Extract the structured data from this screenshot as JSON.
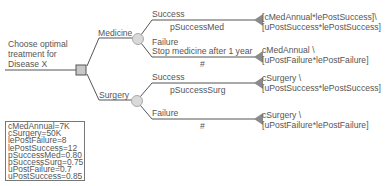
{
  "root": {
    "title_lines": [
      "Choose optimal",
      "treatment for",
      "Disease X"
    ],
    "node_type": "decision"
  },
  "branches": [
    {
      "label": "Medicine",
      "node_type": "chance",
      "outcomes": [
        {
          "label": "Success",
          "probability": "pSuccessMed",
          "payoff_lines": [
            "[cMedAnnual*lePostSuccess]\\",
            "[uPostSuccess*lePostSuccess]"
          ]
        },
        {
          "label": "Failure",
          "sublabel": "Stop medicine after 1 year",
          "probability": "#",
          "payoff_lines": [
            "cMedAnnual \\",
            "[uPostFailure*lePostFailure]"
          ]
        }
      ]
    },
    {
      "label": "Surgery",
      "node_type": "chance",
      "outcomes": [
        {
          "label": "Success",
          "probability": "pSuccessSurg",
          "payoff_lines": [
            "cSurgery \\",
            "[uPostSuccess*lePostSuccess]"
          ]
        },
        {
          "label": "Failure",
          "probability": "#",
          "payoff_lines": [
            "cSurgery \\",
            "[uPostFailure*lePostFailure]"
          ]
        }
      ]
    }
  ],
  "parameters": [
    "cMedAnnual=7K",
    "cSurgery=50K",
    "lePostFailure=8",
    "lePostSuccess=12",
    "pSuccessMed=0.80",
    "pSuccessSurg=0.75",
    "uPostFailure=0.7",
    "uPostSuccess=0.85"
  ],
  "colors": {
    "line": "#555555",
    "node_fill": "#c8c8c8",
    "terminal": "#8a8a8a"
  }
}
